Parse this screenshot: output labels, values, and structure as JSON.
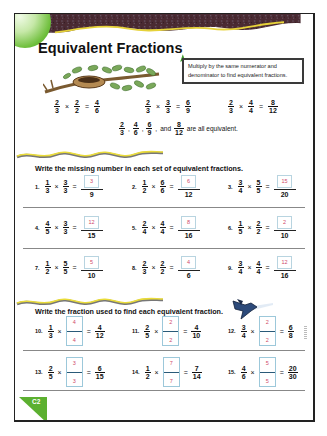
{
  "header": {
    "title": "Equivalent Fractions",
    "tip": "Multiply by the same numerator and denominator to find equivalent fractions."
  },
  "examples": [
    {
      "a": {
        "n": "2",
        "d": "3"
      },
      "op": "×",
      "b": {
        "n": "2",
        "d": "2"
      },
      "eq": "=",
      "r": {
        "n": "4",
        "d": "6"
      }
    },
    {
      "a": {
        "n": "2",
        "d": "3"
      },
      "op": "×",
      "b": {
        "n": "3",
        "d": "3"
      },
      "eq": "=",
      "r": {
        "n": "6",
        "d": "9"
      }
    },
    {
      "a": {
        "n": "2",
        "d": "3"
      },
      "op": "×",
      "b": {
        "n": "4",
        "d": "4"
      },
      "eq": "=",
      "r": {
        "n": "8",
        "d": "12"
      }
    }
  ],
  "equivalence": {
    "fractions": [
      {
        "n": "2",
        "d": "3",
        "sep": ","
      },
      {
        "n": "4",
        "d": "6",
        "sep": ","
      },
      {
        "n": "6",
        "d": "9",
        "sep": ","
      }
    ],
    "and_label": "and",
    "last": {
      "n": "8",
      "d": "12"
    },
    "suffix": "are all equivalent."
  },
  "section1": {
    "instruction": "Write the missing number in each set of equivalent fractions.",
    "problems": [
      {
        "num": "1.",
        "a": {
          "n": "1",
          "d": "3"
        },
        "b": {
          "n": "3",
          "d": "3"
        },
        "answer": "3",
        "d": "9"
      },
      {
        "num": "2.",
        "a": {
          "n": "1",
          "d": "2"
        },
        "b": {
          "n": "6",
          "d": "6"
        },
        "answer": "6",
        "d": "12"
      },
      {
        "num": "3.",
        "a": {
          "n": "3",
          "d": "4"
        },
        "b": {
          "n": "5",
          "d": "5"
        },
        "answer": "15",
        "d": "20"
      },
      {
        "num": "4.",
        "a": {
          "n": "4",
          "d": "5"
        },
        "b": {
          "n": "3",
          "d": "3"
        },
        "answer": "12",
        "d": "15"
      },
      {
        "num": "5.",
        "a": {
          "n": "2",
          "d": "4"
        },
        "b": {
          "n": "4",
          "d": "4"
        },
        "answer": "8",
        "d": "16"
      },
      {
        "num": "6.",
        "a": {
          "n": "1",
          "d": "5"
        },
        "b": {
          "n": "2",
          "d": "2"
        },
        "answer": "2",
        "d": "10"
      },
      {
        "num": "7.",
        "a": {
          "n": "1",
          "d": "2"
        },
        "b": {
          "n": "5",
          "d": "5"
        },
        "answer": "5",
        "d": "10"
      },
      {
        "num": "8.",
        "a": {
          "n": "2",
          "d": "3"
        },
        "b": {
          "n": "2",
          "d": "2"
        },
        "answer": "4",
        "d": "6"
      },
      {
        "num": "9.",
        "a": {
          "n": "3",
          "d": "4"
        },
        "b": {
          "n": "4",
          "d": "4"
        },
        "answer": "12",
        "d": "16"
      }
    ]
  },
  "section2": {
    "instruction": "Write the fraction used to find each equivalent fraction.",
    "problems": [
      {
        "num": "10.",
        "a": {
          "n": "1",
          "d": "3"
        },
        "answer_n": "4",
        "answer_d": "4",
        "r": {
          "n": "4",
          "d": "12"
        }
      },
      {
        "num": "11.",
        "a": {
          "n": "2",
          "d": "5"
        },
        "answer_n": "2",
        "answer_d": "2",
        "r": {
          "n": "4",
          "d": "10"
        }
      },
      {
        "num": "12.",
        "a": {
          "n": "3",
          "d": "4"
        },
        "answer_n": "2",
        "answer_d": "2",
        "r": {
          "n": "6",
          "d": "8"
        }
      },
      {
        "num": "13.",
        "a": {
          "n": "2",
          "d": "5"
        },
        "answer_n": "3",
        "answer_d": "3",
        "r": {
          "n": "6",
          "d": "15"
        }
      },
      {
        "num": "14.",
        "a": {
          "n": "1",
          "d": "2"
        },
        "answer_n": "7",
        "answer_d": "7",
        "r": {
          "n": "7",
          "d": "14"
        }
      },
      {
        "num": "15.",
        "a": {
          "n": "4",
          "d": "6"
        },
        "answer_n": "5",
        "answer_d": "5",
        "r": {
          "n": "20",
          "d": "30"
        }
      }
    ]
  },
  "ops": {
    "times": "×",
    "equals": "="
  },
  "footer": {
    "page_tag": "C2"
  },
  "colors": {
    "accent_green": "#5cb030",
    "answer_pink": "#d04a6a",
    "box_blue": "#9cc8da",
    "banner_dark": "#4a2a30",
    "wave_yellow": "#e8d83a"
  }
}
